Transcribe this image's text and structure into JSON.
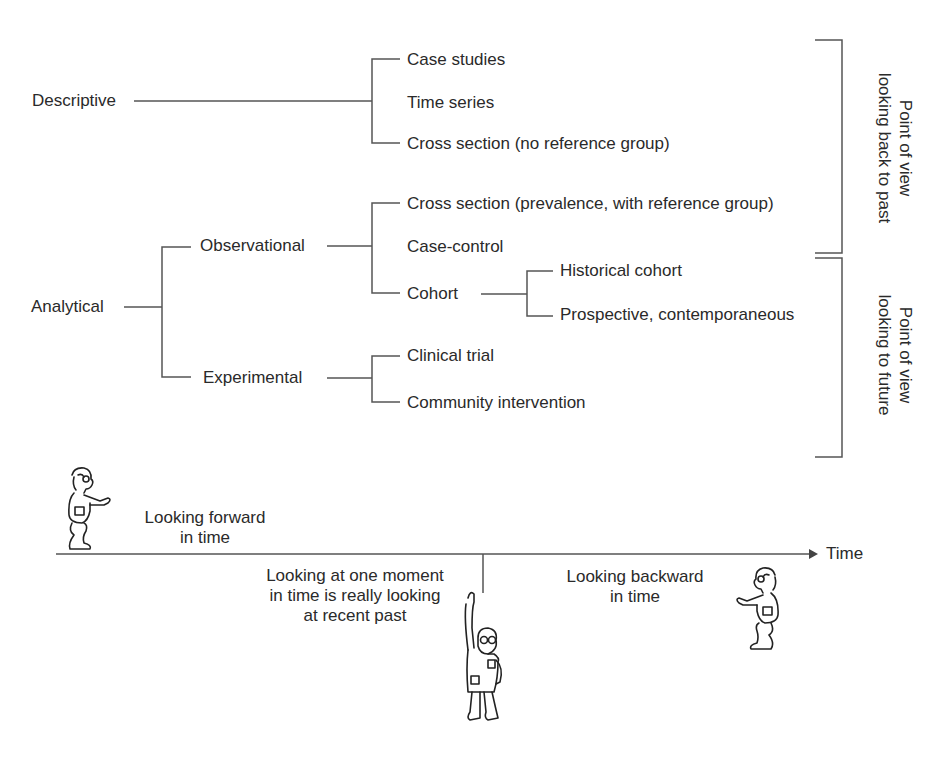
{
  "diagram": {
    "descriptive": {
      "label": "Descriptive",
      "children": [
        "Case studies",
        "Time series",
        "Cross section (no reference group)"
      ]
    },
    "analytical": {
      "label": "Analytical",
      "observational": {
        "label": "Observational",
        "children": [
          "Cross section (prevalence, with reference group)",
          "Case-control",
          "Cohort"
        ],
        "cohort_children": [
          "Historical cohort",
          "Prospective, contemporaneous"
        ]
      },
      "experimental": {
        "label": "Experimental",
        "children": [
          "Clinical trial",
          "Community intervention"
        ]
      }
    },
    "brackets": {
      "past": [
        "Point of view",
        "looking back to past"
      ],
      "future": [
        "Point of view",
        "looking to future"
      ]
    }
  },
  "timeline": {
    "axis_label": "Time",
    "forward": [
      "Looking forward",
      "in time"
    ],
    "moment": [
      "Looking at one moment",
      "in time is really looking",
      "at recent past"
    ],
    "backward": [
      "Looking backward",
      "in time"
    ]
  },
  "colors": {
    "ink": "#2a2a2a",
    "line": "#555555"
  }
}
